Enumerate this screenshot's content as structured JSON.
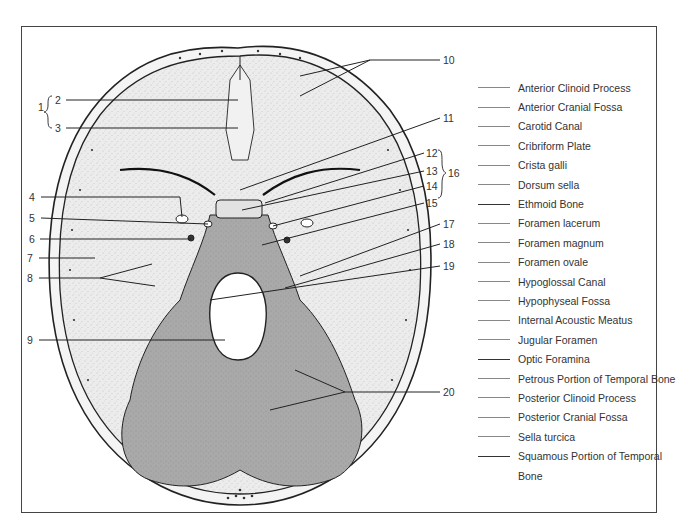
{
  "figure": {
    "colors": {
      "bone_light": "#ececec",
      "bone_posterior": "#a9a9a9",
      "outline": "#222222",
      "frame": "#444444",
      "background": "#ffffff"
    }
  },
  "callouts": {
    "left": [
      {
        "n": "1",
        "x": 38,
        "y": 107
      },
      {
        "n": "2",
        "x": 55,
        "y": 94
      },
      {
        "n": "3",
        "x": 55,
        "y": 122
      },
      {
        "n": "4",
        "x": 29,
        "y": 192
      },
      {
        "n": "5",
        "x": 29,
        "y": 213
      },
      {
        "n": "6",
        "x": 29,
        "y": 233
      },
      {
        "n": "7",
        "x": 27,
        "y": 252
      },
      {
        "n": "8",
        "x": 27,
        "y": 272
      },
      {
        "n": "9",
        "x": 27,
        "y": 334
      }
    ],
    "right": [
      {
        "n": "10",
        "x": 443,
        "y": 54
      },
      {
        "n": "11",
        "x": 443,
        "y": 112
      },
      {
        "n": "12",
        "x": 426,
        "y": 148
      },
      {
        "n": "13",
        "x": 426,
        "y": 166
      },
      {
        "n": "14",
        "x": 426,
        "y": 181
      },
      {
        "n": "15",
        "x": 426,
        "y": 197
      },
      {
        "n": "16",
        "x": 444,
        "y": 172
      },
      {
        "n": "17",
        "x": 443,
        "y": 218
      },
      {
        "n": "18",
        "x": 443,
        "y": 238
      },
      {
        "n": "19",
        "x": 443,
        "y": 261
      },
      {
        "n": "20",
        "x": 443,
        "y": 386
      }
    ]
  },
  "term_list": [
    {
      "label": "Anterior Clinoid Process"
    },
    {
      "label": "Anterior Cranial Fossa"
    },
    {
      "label": "Carotid Canal"
    },
    {
      "label": "Cribriform Plate"
    },
    {
      "label": "Crista galli"
    },
    {
      "label": "Dorsum sella"
    },
    {
      "label": "Ethmoid Bone"
    },
    {
      "label": "Foramen lacerum"
    },
    {
      "label": "Foramen magnum"
    },
    {
      "label": "Foramen ovale"
    },
    {
      "label": "Hypoglossal Canal"
    },
    {
      "label": "Hypophyseal Fossa"
    },
    {
      "label": "Internal Acoustic Meatus"
    },
    {
      "label": "Jugular Foramen"
    },
    {
      "label": "Optic Foramina"
    },
    {
      "label": "Petrous Portion of Temporal Bone"
    },
    {
      "label": "Posterior Clinoid Process"
    },
    {
      "label": "Posterior Cranial Fossa"
    },
    {
      "label": "Sella turcica"
    },
    {
      "label": "Squamous Portion of Temporal"
    },
    {
      "label": "Bone"
    }
  ]
}
